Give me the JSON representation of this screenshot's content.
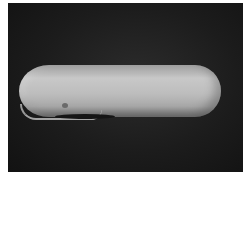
{
  "image": {
    "subject": "elongated pale shell on dark background",
    "background_color": "#1c1c1c",
    "object_color": "#bdbdbd",
    "border_color": "#ffffff"
  }
}
